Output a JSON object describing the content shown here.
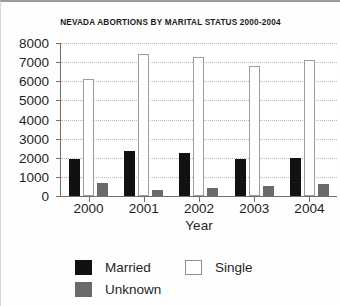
{
  "chart_data": {
    "type": "bar",
    "title": "NEVADA ABORTIONS BY MARITAL STATUS 2000-2004",
    "xlabel": "Year",
    "ylabel": "",
    "categories": [
      "2000",
      "2001",
      "2002",
      "2003",
      "2004"
    ],
    "series": [
      {
        "name": "Married",
        "color": "#111111",
        "values": [
          1940,
          2360,
          2250,
          1960,
          1990
        ]
      },
      {
        "name": "Single",
        "color": "#ffffff",
        "values": [
          6100,
          7430,
          7250,
          6800,
          7100
        ]
      },
      {
        "name": "Unknown",
        "color": "#6a6a6a",
        "values": [
          690,
          310,
          400,
          520,
          620
        ]
      }
    ],
    "ylim": [
      0,
      8000
    ],
    "ytick_values": [
      0,
      1000,
      2000,
      3000,
      4000,
      5000,
      6000,
      7000,
      8000
    ],
    "ytick_labels": [
      "0",
      "1000",
      "2000",
      "3000",
      "4000",
      "5000",
      "6000",
      "7000",
      "8000"
    ],
    "grid": true,
    "grid_style": "dotted",
    "grid_color": "#b9b9b9",
    "legend_position": "bottom",
    "legend_entries": [
      {
        "label": "Married",
        "swatch": "sw-married"
      },
      {
        "label": "Single",
        "swatch": "sw-single"
      },
      {
        "label": "Unknown",
        "swatch": "sw-unknown"
      }
    ]
  }
}
